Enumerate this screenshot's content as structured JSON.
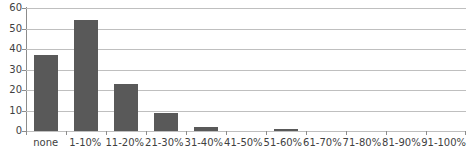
{
  "chart_data": {
    "type": "bar",
    "title": "",
    "subtitle": "",
    "xlabel": "",
    "ylabel": "",
    "categories": [
      "none",
      "1-10%",
      "11-20%",
      "21-30%",
      "31-40%",
      "41-50%",
      "51-60%",
      "61-70%",
      "71-80%",
      "81-90%",
      "91-100%"
    ],
    "values": [
      37,
      54,
      23,
      9,
      2,
      0,
      1,
      0,
      0,
      0,
      0
    ],
    "ylim": [
      0,
      60
    ],
    "yticks": [
      0,
      10,
      20,
      30,
      40,
      50,
      60
    ],
    "ytick_labels": [
      "0",
      "10",
      "20",
      "30",
      "40",
      "50",
      "60"
    ],
    "grid": true,
    "grid_axis": "y",
    "legend": false,
    "legend_position": "none",
    "bar_color": "#595959",
    "grid_color": "#bfbfbf",
    "axis_color": "#8c8c8c",
    "text_color": "#3f3f3f",
    "background": "#ffffff"
  }
}
